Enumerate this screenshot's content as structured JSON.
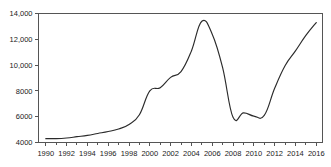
{
  "chart_data": {
    "type": "line",
    "title": "",
    "subtitle": "",
    "xlabel": "",
    "ylabel": "",
    "xlim": [
      1989.3,
      2016.6
    ],
    "ylim": [
      4000,
      14000
    ],
    "grid": false,
    "legend": null,
    "legend_position": "none",
    "line_color": "#2b2b2b",
    "axis_color": "#555555",
    "background_color": "#ffffff",
    "y_ticks": [
      4000,
      6000,
      8000,
      10000,
      12000,
      14000
    ],
    "y_tick_labels": [
      "4000",
      "6000",
      "8000",
      "10,000",
      "12,000",
      "14,000"
    ],
    "x_ticks": [
      1990,
      1991,
      1992,
      1993,
      1994,
      1995,
      1996,
      1997,
      1998,
      1999,
      2000,
      2001,
      2002,
      2003,
      2004,
      2005,
      2006,
      2007,
      2008,
      2009,
      2010,
      2011,
      2012,
      2013,
      2014,
      2015,
      2016
    ],
    "x_tick_labels": [
      "1990",
      "1992",
      "1994",
      "1996",
      "1998",
      "2000",
      "2002",
      "2004",
      "2006",
      "2008",
      "2010",
      "2012",
      "2014",
      "2016"
    ],
    "x_labeled_ticks": [
      1990,
      1992,
      1994,
      1996,
      1998,
      2000,
      2002,
      2004,
      2006,
      2008,
      2010,
      2012,
      2014,
      2016
    ],
    "series": [
      {
        "name": "series-1",
        "x": [
          1990,
          1991,
          1992,
          1993,
          1994,
          1995,
          1996,
          1997,
          1998,
          1999,
          2000,
          2001,
          2002,
          2003,
          2004,
          2005,
          2006,
          2007,
          2008,
          2009,
          2010,
          2011,
          2012,
          2013,
          2014,
          2015,
          2016
        ],
        "values": [
          4300,
          4300,
          4350,
          4450,
          4550,
          4700,
          4850,
          5050,
          5400,
          6150,
          8000,
          8250,
          9050,
          9500,
          11100,
          13400,
          12400,
          9800,
          5950,
          6300,
          6050,
          6100,
          8200,
          9950,
          11100,
          12300,
          13300
        ]
      }
    ]
  }
}
